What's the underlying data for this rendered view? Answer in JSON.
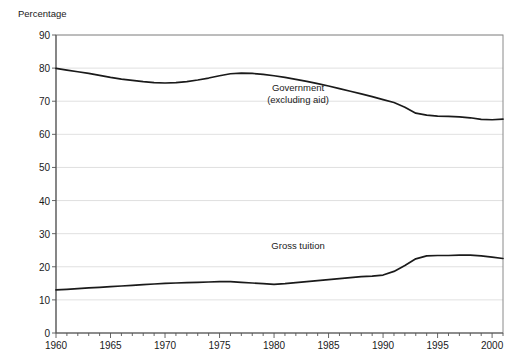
{
  "chart_data": {
    "type": "line",
    "title": "",
    "xlabel": "",
    "ylabel": "Percentage",
    "ylim": [
      0,
      90
    ],
    "xlim": [
      1960,
      2001
    ],
    "ytick_step": 10,
    "xtick_step": 5,
    "grid": true,
    "legend_position": "inline-annotation",
    "yticks": [
      "0",
      "10",
      "20",
      "30",
      "40",
      "50",
      "60",
      "70",
      "80",
      "90"
    ],
    "xticks": [
      "1960",
      "1965",
      "1970",
      "1975",
      "1980",
      "1985",
      "1990",
      "1995",
      "2000"
    ],
    "x": [
      1960,
      1961,
      1962,
      1963,
      1964,
      1965,
      1966,
      1967,
      1968,
      1969,
      1970,
      1971,
      1972,
      1973,
      1974,
      1975,
      1976,
      1977,
      1978,
      1979,
      1980,
      1981,
      1982,
      1983,
      1984,
      1985,
      1986,
      1987,
      1988,
      1989,
      1990,
      1991,
      1992,
      1993,
      1994,
      1995,
      1996,
      1997,
      1998,
      1999,
      2000,
      2001
    ],
    "series": [
      {
        "name": "Government (excluding aid)",
        "label_line1": "Government",
        "label_line2": "(excluding aid)",
        "color": "#1a1a1a",
        "values": [
          79.9,
          79.4,
          78.9,
          78.4,
          77.8,
          77.2,
          76.7,
          76.3,
          75.9,
          75.6,
          75.5,
          75.6,
          75.9,
          76.4,
          77.0,
          77.7,
          78.3,
          78.5,
          78.4,
          78.1,
          77.7,
          77.2,
          76.6,
          76.0,
          75.3,
          74.6,
          73.8,
          73.0,
          72.2,
          71.4,
          70.5,
          69.6,
          68.2,
          66.4,
          65.8,
          65.5,
          65.4,
          65.3,
          65.0,
          64.5,
          64.4,
          64.6
        ]
      },
      {
        "name": "Gross tuition",
        "label_line1": "Gross tuition",
        "label_line2": "",
        "color": "#1a1a1a",
        "values": [
          13.0,
          13.2,
          13.4,
          13.6,
          13.8,
          14.0,
          14.2,
          14.4,
          14.6,
          14.8,
          15.0,
          15.1,
          15.2,
          15.3,
          15.4,
          15.5,
          15.5,
          15.3,
          15.1,
          14.9,
          14.7,
          14.9,
          15.2,
          15.5,
          15.8,
          16.1,
          16.4,
          16.7,
          17.0,
          17.2,
          17.5,
          18.6,
          20.4,
          22.4,
          23.3,
          23.4,
          23.4,
          23.5,
          23.5,
          23.3,
          22.9,
          22.5
        ]
      }
    ],
    "annotations": [
      {
        "text": "Government",
        "x": 1982.2,
        "y": 74.0
      },
      {
        "text": "(excluding aid)",
        "x": 1982.2,
        "y": 70.3
      },
      {
        "text": "Gross tuition",
        "x": 1982.2,
        "y": 26.2
      }
    ]
  }
}
